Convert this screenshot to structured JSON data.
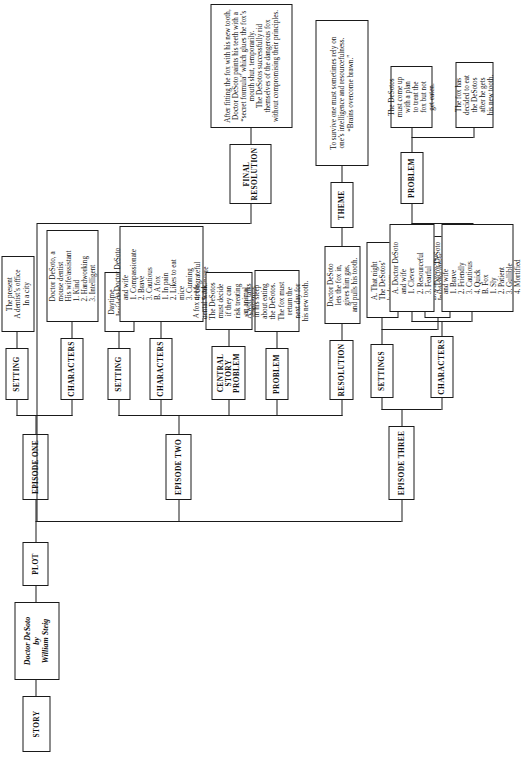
{
  "diagram": {
    "title_node": "STORY",
    "book": "Doctor DeSoto\nby\nWilliam Steig",
    "plot": "PLOT",
    "final_resolution_label": "FINAL\nRESOLUTION",
    "final_resolution_text": "After fitting the fox with his new tooth, Doctor DeSoto paints his teeth with a “secret formula” which glues the fox’s mouth shut, temporarily.\nThe DeSotos successfully rid themselves of the dangerous fox without compromising their principles.",
    "central_problem_label": "CENTRAL\nSTORY\nPROBLEM",
    "central_problem_text": "A fox needs\ndental work.\nThe DeSotos\nmust decide\nif they can\nrisk treating\nan animal\ndangerous\nto mice.",
    "theme_label": "THEME",
    "theme_text": "To survive one must sometimes rely on\none’s intelligence and resourcefulness.\n“Brains overcome brawn.”",
    "episodes": [
      {
        "label": "EPISODE ONE",
        "setting_label": "SETTING",
        "setting_text": "The present\nA dentist’s office\nIn a city",
        "characters_label": "CHARACTERS",
        "characters_text": "Doctor DeSoto, a\nmouse dentist\nHis wife/assistant\n  1.  Kind\n  2.  Hardworking\n  3.  Intelligent"
      },
      {
        "label": "EPISODE TWO",
        "setting_label": "SETTING",
        "setting_text": "Daytime\nInside the\noffice",
        "characters_label": "CHARACTERS",
        "characters_text": "A.  Doctor DeSoto\n      and wife\n        1.  Compassionate\n        2.  Brave\n        3.  Cautious\n  B.  A fox\n        1.  In pain\n        2.  Likes to eat\n              mice\n        3.  Cunning\n        4.  Ungrateful\n        5.  Insincere",
        "problem_label": "PROBLEM",
        "problem_text": "A wolf talks\nin his sleep\nabout eating\nthe DeSotos.\nThe fox must\nreturn the\nnext day for\nhis new tooth.",
        "resolution_label": "RESOLUTION",
        "resolution_text": "Doctor DeSoto\nlets the fox in,\ngives him gas,\nand pulls his tooth."
      },
      {
        "label": "EPISODE THREE",
        "settings_label": "SETTINGS",
        "settings_a": "A.   That night\n        The DeSotos’\n        bedroom",
        "settings_b": "B.   The next day\n        Inside the office",
        "characters_label": "CHARACTERS",
        "characters_a": "A.  Doctor DeSoto\n      and wife\n        1.  Clever\n        2.  Resourceful\n        3.  Fearful",
        "characters_b": "A.  Doctor DeSoto\n      and wife\n        1.  Brave\n        2.  Friendly\n        3.  Cautious\n        4.  Quick\n  B.  Fox\n        1.  Sly\n        2.  Patient\n        3.  Gullible\n        4.  Mortified",
        "problem_label": "PROBLEM",
        "problem_a": "The DeSotos\nmust come up\nwith a plan\nto treat the\nfox but not\nget eaten.",
        "problem_b": "The fox has\ndecided to eat\nthe DeSotos\nafter he gets\nhis new tooth."
      }
    ]
  }
}
